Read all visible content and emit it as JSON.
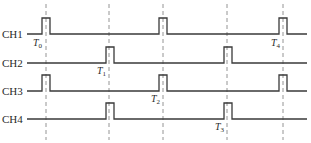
{
  "diagram": {
    "title": "",
    "channels": [
      {
        "label": "CH1",
        "baseline_y": 34,
        "pulses_x": [
          42,
          159,
          279
        ]
      },
      {
        "label": "CH2",
        "baseline_y": 63,
        "pulses_x": [
          106,
          224
        ]
      },
      {
        "label": "CH3",
        "baseline_y": 91,
        "pulses_x": [
          42,
          159,
          279
        ]
      },
      {
        "label": "CH4",
        "baseline_y": 119,
        "pulses_x": [
          106,
          224
        ]
      }
    ],
    "pulse": {
      "width": 8,
      "height": 16
    },
    "line_start_x": 27,
    "line_end_x": 307,
    "dashed_lines_x": [
      46,
      109,
      163,
      227,
      283
    ],
    "dashed_top_y": 4,
    "dashed_bottom_y": 140,
    "time_markers": [
      {
        "symbol": "T",
        "sub": "0",
        "x": 33,
        "y": 46
      },
      {
        "symbol": "T",
        "sub": "1",
        "x": 97,
        "y": 74
      },
      {
        "symbol": "T",
        "sub": "2",
        "x": 151,
        "y": 102
      },
      {
        "symbol": "T",
        "sub": "3",
        "x": 215,
        "y": 130
      },
      {
        "symbol": "T",
        "sub": "4",
        "x": 271,
        "y": 46
      }
    ],
    "colors": {
      "signal": "#3a3a3a",
      "dashed": "#7a7a7a",
      "text": "#2a2a2a",
      "background": "#ffffff"
    }
  }
}
